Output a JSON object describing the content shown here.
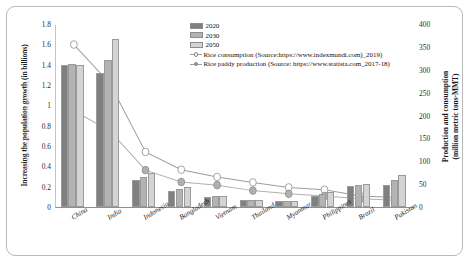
{
  "chart_data": {
    "type": "bar",
    "title": "",
    "categories": [
      "China",
      "India",
      "Indonesia",
      "Bangladesh",
      "Vietnam",
      "Thailand",
      "Myanmar",
      "Philippines",
      "Brazil",
      "Pakistan"
    ],
    "series": [
      {
        "name": "2020",
        "values": [
          1.4,
          1.32,
          0.27,
          0.16,
          0.1,
          0.07,
          0.06,
          0.11,
          0.21,
          0.22
        ],
        "axis": "left",
        "color": "#808080"
      },
      {
        "name": "2030",
        "values": [
          1.41,
          1.45,
          0.3,
          0.18,
          0.11,
          0.07,
          0.06,
          0.13,
          0.22,
          0.27
        ],
        "axis": "left",
        "color": "#b3b3b3"
      },
      {
        "name": "2050",
        "values": [
          1.4,
          1.65,
          0.33,
          0.2,
          0.11,
          0.07,
          0.06,
          0.15,
          0.23,
          0.31
        ],
        "axis": "left",
        "color": "#d4d4d4"
      }
    ],
    "line_series": [
      {
        "name": "Rice consumption (Source:https://www.indexmundi.com)_2019)",
        "values": [
          357,
          272,
          121,
          82,
          66,
          54,
          43,
          38,
          24,
          21
        ],
        "axis": "right",
        "marker": "open-circle",
        "color": "#9d9d9d"
      },
      {
        "name": "Rice paddy production (Source: https://www.statista.com_2017-18)",
        "values": [
          211,
          168,
          81,
          55,
          48,
          36,
          29,
          24,
          18,
          15
        ],
        "axis": "right",
        "marker": "filled-circle",
        "color": "#b0b0b0"
      }
    ],
    "ylabel": "Increasing the population growth (in billions)",
    "ylabel_watermark": "Source: https://www.wikipedia.org",
    "y2label": "Production and  consumption\n(million metric tons-MMT)",
    "ylim": [
      0,
      1.8
    ],
    "y2lim": [
      0,
      400
    ],
    "yticks": [
      "1.8",
      "1.6",
      "1.4",
      "1.2",
      "1",
      "0.8",
      "0.6",
      "0.4",
      "0.2",
      "0"
    ],
    "y2ticks": [
      "400",
      "350",
      "300",
      "250",
      "200",
      "150",
      "100",
      "50",
      "0"
    ],
    "xlabel": "",
    "grid": false,
    "legend_position": "top-right"
  },
  "legend": {
    "bars": [
      {
        "label": "2020"
      },
      {
        "label": "2030"
      },
      {
        "label": "2050"
      }
    ],
    "lines": [
      {
        "label": "Rice consumption (Source:https://www.indexmundi.com)_2019)"
      },
      {
        "label": "Rice paddy production (Source: https://www.statista.com_2017-18)"
      }
    ]
  },
  "axes": {
    "left_title": "Increasing the population growth (in billions)",
    "left_watermark": "Source: https://www.wikipedia.org",
    "right_title_line1": "Production and  consumption",
    "right_title_line2": "(million metric tons-MMT)"
  }
}
